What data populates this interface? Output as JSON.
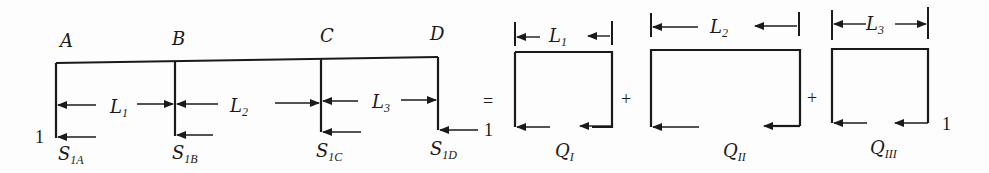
{
  "diagram": {
    "ink_color": "#1a1a1a",
    "background": "#fdfdfd",
    "frame": {
      "nodes": [
        {
          "id": "A",
          "label": "A"
        },
        {
          "id": "B",
          "label": "B"
        },
        {
          "id": "C",
          "label": "C"
        },
        {
          "id": "D",
          "label": "D"
        }
      ],
      "spans": [
        {
          "label": "L",
          "sub": "1"
        },
        {
          "label": "L",
          "sub": "2"
        },
        {
          "label": "L",
          "sub": "3"
        }
      ],
      "shears": [
        {
          "label": "S",
          "sub": "1A"
        },
        {
          "label": "S",
          "sub": "1B"
        },
        {
          "label": "S",
          "sub": "1C"
        },
        {
          "label": "S",
          "sub": "1D"
        }
      ],
      "load_left": "1",
      "load_right": "1"
    },
    "equals": "=",
    "plus": "+",
    "cells": [
      {
        "span": {
          "label": "L",
          "sub": "1"
        },
        "flow": {
          "label": "Q",
          "sub": "I"
        }
      },
      {
        "span": {
          "label": "L",
          "sub": "2"
        },
        "flow": {
          "label": "Q",
          "sub": "II"
        }
      },
      {
        "span": {
          "label": "L",
          "sub": "3"
        },
        "flow": {
          "label": "Q",
          "sub": "III"
        },
        "load": "1"
      }
    ]
  }
}
